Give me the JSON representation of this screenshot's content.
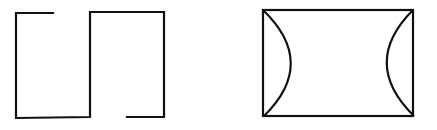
{
  "figure": {
    "width": 437,
    "height": 130,
    "background": "#ffffff",
    "stroke_color": "#111111",
    "stroke_width": 2.2,
    "shapes": [
      {
        "name": "left-figure-open-rectangles",
        "description": "Two adjoining open rectangles forming an S/square-wave path",
        "path": "M 53 13 L 16 13 L 16 118 L 90 117 L 90 12 L 164 12 L 164 117 L 127 117"
      },
      {
        "name": "right-figure-rectangle",
        "description": "Closed rectangle",
        "x": 263,
        "y": 10,
        "width": 150,
        "height": 106
      },
      {
        "name": "right-figure-left-arc",
        "description": "Arc bulging inward from the left edge",
        "path": "M 263 10 Q 318 63 264 116"
      },
      {
        "name": "right-figure-right-arc",
        "description": "Arc bulging inward from the right edge",
        "path": "M 413 10 Q 360 63 414 116"
      }
    ]
  }
}
